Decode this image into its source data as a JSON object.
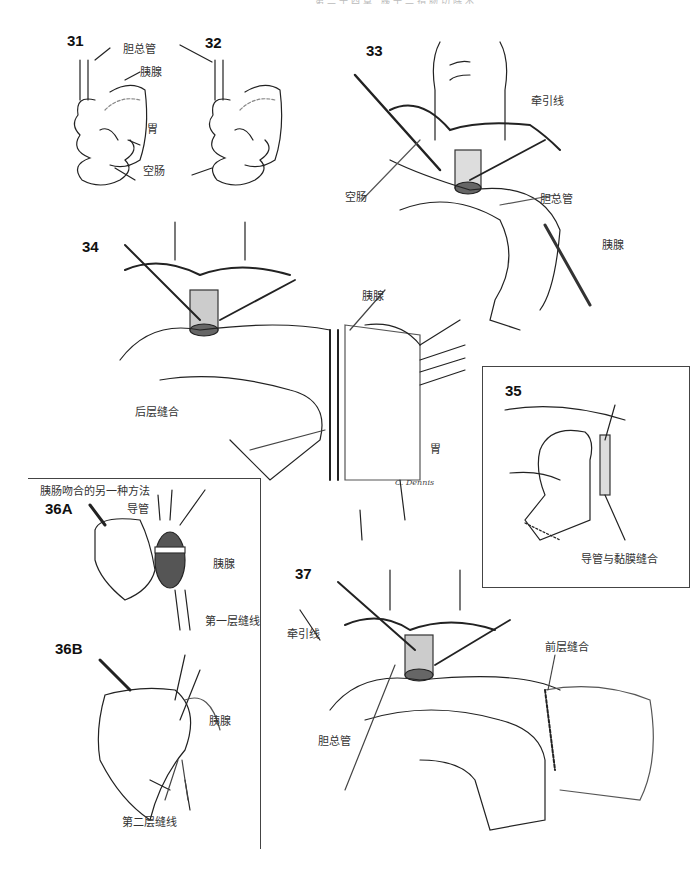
{
  "header": {
    "running_head": "第二十四章 胰十二指肠切除术"
  },
  "figures": [
    {
      "id": "31",
      "labels": [
        "胆总管",
        "胰腺",
        "胃",
        "空肠"
      ]
    },
    {
      "id": "32",
      "labels": []
    },
    {
      "id": "33",
      "labels": [
        "牵引线",
        "空肠",
        "胆总管",
        "胰腺"
      ]
    },
    {
      "id": "34",
      "labels": [
        "胰腺",
        "后层缝合",
        "胃"
      ]
    },
    {
      "id": "35",
      "labels": [
        "导管与黏膜缝合"
      ]
    },
    {
      "id": "36A",
      "labels": [
        "胰肠吻合的另一种方法",
        "导管",
        "胰腺",
        "第一层缝线"
      ]
    },
    {
      "id": "36B",
      "labels": [
        "胰腺",
        "第二层缝线"
      ]
    },
    {
      "id": "37",
      "labels": [
        "牵引线",
        "胆总管",
        "前层缝合"
      ]
    }
  ],
  "signature": "C. Dennis"
}
